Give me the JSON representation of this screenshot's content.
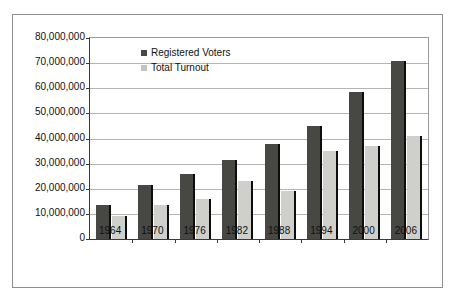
{
  "chart_data": {
    "type": "bar",
    "title": "",
    "subtitle": "",
    "xlabel": "",
    "ylabel": "",
    "categories": [
      "1964",
      "1970",
      "1976",
      "1982",
      "1988",
      "1994",
      "2000",
      "2006"
    ],
    "series": [
      {
        "name": "Registered Voters",
        "color": "#474744",
        "values": [
          13500000,
          21500000,
          26000000,
          31500000,
          38000000,
          45000000,
          58500000,
          71000000
        ]
      },
      {
        "name": "Total Turnout",
        "color": "#cfcfcb",
        "values": [
          9000000,
          13500000,
          16000000,
          23000000,
          19000000,
          35000000,
          37000000,
          41000000
        ]
      }
    ],
    "ylim": [
      0,
      80000000
    ],
    "ytick_values": [
      0,
      10000000,
      20000000,
      30000000,
      40000000,
      50000000,
      60000000,
      70000000,
      80000000
    ],
    "ytick_labels": [
      "0",
      "10,000,000",
      "20,000,000",
      "30,000,000",
      "40,000,000",
      "50,000,000",
      "60,000,000",
      "70,000,000",
      "80,000,000"
    ],
    "grid": true,
    "grid_axis": "y",
    "legend_position": "top-left-inside",
    "legend": [
      "Registered Voters",
      "Total Turnout"
    ],
    "annotations": []
  }
}
